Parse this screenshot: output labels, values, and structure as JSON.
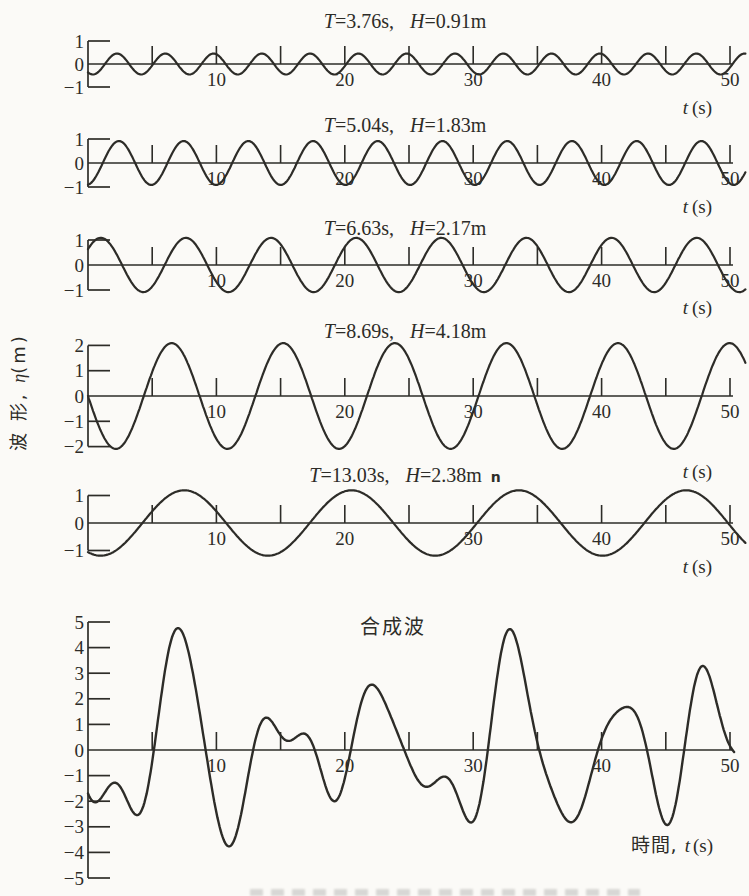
{
  "figure": {
    "ylabel_cjk": "波 形, ",
    "ylabel_symbol": "η",
    "ylabel_unit": "(m)",
    "ink": "#2d2c28",
    "paper": "#fbfaf7"
  },
  "chart_data": {
    "type": "line",
    "description_visible_text_only": true,
    "symbols": {
      "period": "T",
      "height": "H"
    },
    "x_axis": {
      "var": "t",
      "unit": "(s)",
      "min": 0,
      "max": 50,
      "tick_step_s": 5,
      "labeled_ticks": [
        10,
        20,
        30,
        40,
        50
      ]
    },
    "panels": [
      {
        "name": "component-1",
        "T_eq": "=3.76s,",
        "H_eq": "=0.91m",
        "suffix": "",
        "period_s": 3.76,
        "height_m": 0.91,
        "amplitude_m": 0.455,
        "phase_upcross_s": 1.32,
        "ylim": [
          -1,
          1
        ],
        "yticks": [
          1,
          0,
          -1
        ]
      },
      {
        "name": "component-2",
        "T_eq": "=5.04s,",
        "H_eq": "=1.83m",
        "suffix": "",
        "period_s": 5.04,
        "height_m": 1.83,
        "amplitude_m": 0.915,
        "phase_upcross_s": 1.15,
        "ylim": [
          -1,
          1
        ],
        "yticks": [
          1,
          0,
          -1
        ]
      },
      {
        "name": "component-3",
        "T_eq": "=6.63s,",
        "H_eq": "=2.17m",
        "suffix": "",
        "period_s": 6.63,
        "height_m": 2.17,
        "amplitude_m": 1.085,
        "phase_upcross_s": -0.66,
        "ylim": [
          -1,
          1
        ],
        "yticks": [
          1,
          0,
          -1
        ]
      },
      {
        "name": "component-4",
        "T_eq": "=8.69s,",
        "H_eq": "=4.18m",
        "suffix": "",
        "period_s": 8.69,
        "height_m": 4.18,
        "amplitude_m": 2.09,
        "phase_upcross_s": 4.345,
        "ylim": [
          -2,
          2
        ],
        "yticks": [
          2,
          1,
          0,
          -1,
          -2
        ]
      },
      {
        "name": "component-5",
        "T_eq": "=13.03s,",
        "H_eq": "=2.38m",
        "suffix": "n",
        "period_s": 13.03,
        "height_m": 2.38,
        "amplitude_m": 1.19,
        "phase_upcross_s": 4.24,
        "ylim": [
          -1,
          1
        ],
        "yticks": [
          1,
          0,
          -1
        ]
      }
    ],
    "composite": {
      "name": "composite-wave",
      "title": "合成波",
      "curve_rule": "sum_of_panels",
      "ylim": [
        -5,
        5
      ],
      "yticks": [
        5,
        4,
        3,
        2,
        1,
        0,
        -1,
        -2,
        -3,
        -4,
        -5
      ],
      "xlabel_cjk": "時間, ",
      "xlabel_var": "t",
      "xlabel_unit": "(s)"
    }
  }
}
